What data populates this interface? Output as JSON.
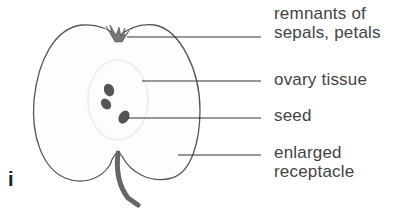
{
  "figure": {
    "panel_letter": "i",
    "labels": [
      {
        "line1": "remnants of",
        "line2": "sepals, petals"
      },
      {
        "line1": "ovary tissue"
      },
      {
        "line1": "seed"
      },
      {
        "line1": "enlarged",
        "line2": "receptacle"
      }
    ],
    "colors": {
      "outline": "#555555",
      "text": "#444444",
      "seed": "#4a4a4a",
      "stalk": "#666666"
    }
  }
}
